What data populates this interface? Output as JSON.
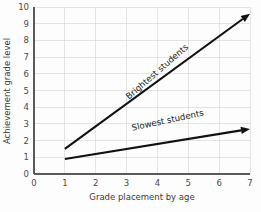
{
  "chart_data": {
    "type": "line",
    "title": "",
    "xlabel": "Grade placement by age",
    "ylabel": "Achievement grade level",
    "xlim": [
      0,
      7
    ],
    "ylim": [
      0,
      10
    ],
    "xticks": [
      "0",
      "1",
      "2",
      "3",
      "4",
      "5",
      "6",
      "7"
    ],
    "yticks": [
      "0",
      "1",
      "2",
      "3",
      "4",
      "5",
      "6",
      "7",
      "8",
      "9",
      "10"
    ],
    "grid": true,
    "legend": "inline-labels",
    "series": [
      {
        "name": "Brightest students",
        "label": "Brightest students",
        "x": [
          1,
          7
        ],
        "values": [
          1.5,
          9.6
        ],
        "arrow_end": true,
        "label_angle": -41,
        "label_x": 4.05,
        "label_y": 6.0
      },
      {
        "name": "Slowest students",
        "label": "Slowest students",
        "x": [
          1,
          7
        ],
        "values": [
          0.9,
          2.7
        ],
        "arrow_end": true,
        "label_angle": -12,
        "label_x": 4.35,
        "label_y": 3.05
      }
    ],
    "colors": {
      "line": "#111111",
      "grid": "#d8d8d8",
      "axis": "#5a5a5a",
      "text": "#3a3a3a",
      "background": "#fdfdfd"
    }
  }
}
